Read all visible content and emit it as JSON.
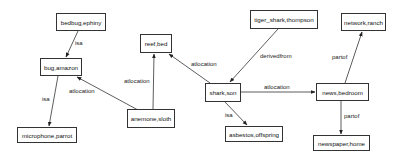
{
  "diagram": {
    "type": "directed-graph",
    "nodes": [
      {
        "id": "n1",
        "label": "bedbug,ephiny"
      },
      {
        "id": "n2",
        "label": "bug,amazon"
      },
      {
        "id": "n3",
        "label": "microphone,parrot"
      },
      {
        "id": "n4",
        "label": "reef,bed"
      },
      {
        "id": "n5",
        "label": "anemone,sloth"
      },
      {
        "id": "n6",
        "label": "tiger_shark,thompson"
      },
      {
        "id": "n7",
        "label": "shark,son"
      },
      {
        "id": "n8",
        "label": "asbestos,offspring"
      },
      {
        "id": "n9",
        "label": "network,ranch"
      },
      {
        "id": "n10",
        "label": "news,bedroom"
      },
      {
        "id": "n11",
        "label": "newspaper,home"
      }
    ],
    "edges": [
      {
        "from": "bedbug,ephiny",
        "to": "bug,amazon",
        "label": "isa"
      },
      {
        "from": "bug,amazon",
        "to": "microphone,parrot",
        "label": "isa"
      },
      {
        "from": "anemone,sloth",
        "to": "bug,amazon",
        "label": "atlocation"
      },
      {
        "from": "anemone,sloth",
        "to": "reef,bed",
        "label": "atlocation"
      },
      {
        "from": "shark,son",
        "to": "reef,bed",
        "label": "atlocation"
      },
      {
        "from": "tiger_shark,thompson",
        "to": "shark,son",
        "label": "derivedfrom"
      },
      {
        "from": "shark,son",
        "to": "asbestos,offspring",
        "label": "isa"
      },
      {
        "from": "shark,son",
        "to": "news,bedroom",
        "label": "atlocation"
      },
      {
        "from": "news,bedroom",
        "to": "network,ranch",
        "label": "partof"
      },
      {
        "from": "news,bedroom",
        "to": "newspaper,home",
        "label": "partof"
      }
    ]
  }
}
